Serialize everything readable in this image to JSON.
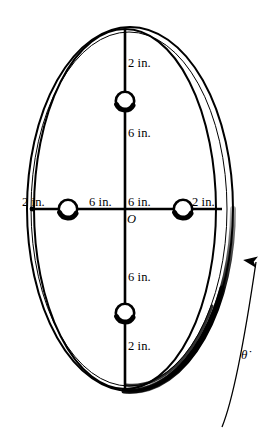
{
  "figure": {
    "background_color": "#ffffff",
    "ink_color": "#000000",
    "center_label": "O",
    "angular_rate_symbol": "θ̇"
  },
  "dimensions": {
    "top_outer": "2 in.",
    "top_inner": "6 in.",
    "left_outer": "2 in.",
    "left_inner": "6 in.",
    "right_inner": "6 in.",
    "right_outer": "2 in.",
    "bottom_inner": "6 in.",
    "bottom_outer": "2 in."
  },
  "labels": [
    {
      "id": "top-outer",
      "text": "2 in.",
      "x": 128,
      "y": 63
    },
    {
      "id": "top-inner",
      "text": "6 in.",
      "x": 128,
      "y": 133
    },
    {
      "id": "left-outer",
      "text": "2 in.",
      "x": 24,
      "y": 196
    },
    {
      "id": "left-inner",
      "text": "6 in.",
      "x": 90,
      "y": 196
    },
    {
      "id": "right-inner",
      "text": "6 in.",
      "x": 128,
      "y": 196
    },
    {
      "id": "right-outer",
      "text": "2 in.",
      "x": 193,
      "y": 196
    },
    {
      "id": "bottom-inner",
      "text": "6 in.",
      "x": 128,
      "y": 277
    },
    {
      "id": "bottom-outer",
      "text": "2 in.",
      "x": 128,
      "y": 344
    }
  ],
  "origin": {
    "text": "O",
    "x": 126,
    "y": 213
  },
  "angular_rate": {
    "text": "θ̇",
    "x": 242,
    "y": 348
  },
  "geometry": {
    "center": {
      "x": 128,
      "y": 209
    },
    "hoop_outer": {
      "rx": 104,
      "ry": 183
    },
    "hoop_inner": {
      "rx": 94,
      "ry": 173
    },
    "beads": [
      {
        "id": "bead-top",
        "cx": 125,
        "cy": 101,
        "r": 9
      },
      {
        "id": "bead-left",
        "cx": 68,
        "cy": 209,
        "r": 9
      },
      {
        "id": "bead-right",
        "cx": 183,
        "cy": 209,
        "r": 9
      },
      {
        "id": "bead-bottom",
        "cx": 125,
        "cy": 313,
        "r": 9
      }
    ],
    "vertical_bar": {
      "x": 125,
      "y_top": 29,
      "y_bottom": 389
    },
    "horizontal_bar": {
      "y": 209,
      "x_left": 32,
      "x_right": 222
    }
  }
}
